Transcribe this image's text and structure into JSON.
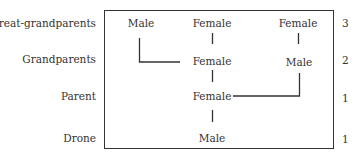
{
  "diagram": {
    "type": "pedigree",
    "subject": "Drone",
    "rows": [
      {
        "label": "Great-grandparents",
        "count": "3"
      },
      {
        "label": "Grandparents",
        "count": "2"
      },
      {
        "label": "Parent",
        "count": "1"
      },
      {
        "label": "Drone",
        "count": "1"
      }
    ],
    "nodes": {
      "ggp_male": "Male",
      "ggp_female_1": "Female",
      "ggp_female_2": "Female",
      "gp_female": "Female",
      "gp_male": "Male",
      "parent_female": "Female",
      "drone_male": "Male"
    },
    "edges": [
      [
        "ggp_male",
        "gp_female"
      ],
      [
        "ggp_female_1",
        "gp_female"
      ],
      [
        "ggp_female_2",
        "gp_male"
      ],
      [
        "gp_female",
        "parent_female"
      ],
      [
        "gp_male",
        "parent_female"
      ],
      [
        "parent_female",
        "drone_male"
      ]
    ],
    "colors": {
      "line": "#333333",
      "text": "#333333",
      "background": "#ffffff"
    }
  }
}
